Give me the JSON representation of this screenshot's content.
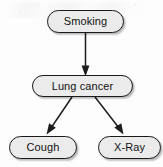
{
  "diagram": {
    "type": "causal-bayesian-network",
    "title": "",
    "background_color": "#fdfdfd",
    "node_fill_color": "#ebebeb",
    "node_border_color": "#1a1a1a",
    "edge_color": "#1d1d1d",
    "nodes": [
      {
        "id": "smoking",
        "label": "Smoking",
        "level": "cause"
      },
      {
        "id": "lung_cancer",
        "label": "Lung cancer",
        "level": "disease"
      },
      {
        "id": "cough",
        "label": "Cough",
        "level": "evidence"
      },
      {
        "id": "xray",
        "label": "X-Ray",
        "level": "evidence"
      }
    ],
    "edges": [
      {
        "from": "smoking",
        "to": "lung_cancer",
        "label": "",
        "style": "solid-arrow"
      },
      {
        "from": "lung_cancer",
        "to": "cough",
        "label": "",
        "style": "solid-arrow"
      },
      {
        "from": "lung_cancer",
        "to": "xray",
        "label": "",
        "style": "solid-arrow"
      }
    ]
  }
}
